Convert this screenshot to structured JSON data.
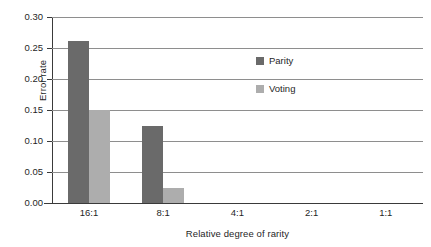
{
  "chart_data": {
    "type": "bar",
    "title": "",
    "xlabel": "Relative degree of rarity",
    "ylabel": "Error rate",
    "categories": [
      "16:1",
      "8:1",
      "4:1",
      "2:1",
      "1:1"
    ],
    "series": [
      {
        "name": "Parity",
        "color": "#6a6a6a",
        "values": [
          0.262,
          0.125,
          0.0,
          0.0,
          0.0
        ]
      },
      {
        "name": "Voting",
        "color": "#adadad",
        "values": [
          0.15,
          0.025,
          0.0,
          0.0,
          0.0
        ]
      }
    ],
    "ylim": [
      0.0,
      0.3
    ],
    "ytick_labels": [
      "0.30",
      "0.25",
      "0.20",
      "0.15",
      "0.10",
      "0.05",
      "0.00"
    ],
    "ytick_values": [
      0.3,
      0.25,
      0.2,
      0.15,
      0.1,
      0.05,
      0.0
    ],
    "grid": true,
    "grid_axis": "y",
    "legend_position": "inside-upper-center",
    "xlim_categories": 5
  },
  "legend": {
    "entries": [
      {
        "label": "Parity",
        "color": "#6a6a6a"
      },
      {
        "label": "Voting",
        "color": "#adadad"
      }
    ]
  },
  "colors": {
    "parity": "#6a6a6a",
    "voting": "#adadad",
    "gridline": "#8e8e8e",
    "axis": "#3a3a3a",
    "background": "#ffffff",
    "text": "#1f1f1f"
  }
}
